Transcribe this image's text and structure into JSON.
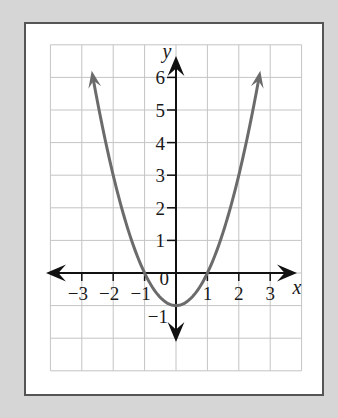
{
  "chart_data": {
    "type": "line",
    "title": "",
    "function": "y = x^2 - 1",
    "xlabel": "x",
    "ylabel": "y",
    "xlim": [
      -4,
      4
    ],
    "ylim": [
      -3,
      7
    ],
    "grid": true,
    "x_ticks": [
      -3,
      -2,
      -1,
      1,
      2,
      3
    ],
    "x_tick_labels": [
      "−3",
      "−2",
      "−1",
      "1",
      "2",
      "3"
    ],
    "y_ticks": [
      -1,
      1,
      2,
      3,
      4,
      5,
      6
    ],
    "y_tick_labels": [
      "−1",
      "1",
      "2",
      "3",
      "4",
      "5",
      "6"
    ],
    "origin_label": "0",
    "series": [
      {
        "name": "parabola",
        "x": [
          -2.65,
          -2,
          -1,
          0,
          1,
          2,
          2.65
        ],
        "y": [
          6.0,
          3,
          0,
          -1,
          0,
          3,
          6.0
        ],
        "arrows_at_ends": true
      }
    ],
    "vertex": [
      0,
      -1
    ],
    "x_intercepts": [
      -1,
      1
    ]
  },
  "colors": {
    "background": "#d6d6d6",
    "frame_border": "#555555",
    "grid": "#c4c4c4",
    "axes": "#111111",
    "curve": "#6b6b6b"
  }
}
